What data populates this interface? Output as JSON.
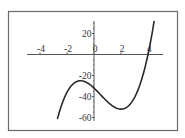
{
  "chart_data": {
    "type": "line",
    "title": "",
    "xlabel": "",
    "ylabel": "",
    "xlim": [
      -5,
      5
    ],
    "ylim": [
      -62,
      32
    ],
    "x_ticks": [
      -4,
      -2,
      0,
      2,
      4
    ],
    "y_ticks": [
      20,
      -20,
      -40,
      -60
    ],
    "x_tick_labels": [
      "-4",
      "-2",
      "0",
      "2",
      "4"
    ],
    "y_tick_labels": [
      "20",
      "-20",
      "-40",
      "-60"
    ],
    "grid": false,
    "legend": null,
    "series": [
      {
        "name": "f(x) = 2x^3 - 3x^2 - 12x - 32",
        "x_range": [
          -2.7,
          4.45
        ],
        "x": [
          -2.7,
          -2.5,
          -2,
          -1.5,
          -1,
          -0.5,
          0,
          0.5,
          1,
          1.5,
          2,
          2.5,
          3,
          3.5,
          4,
          4.25,
          4.45
        ],
        "values": [
          -60.9,
          -53.0,
          -36.0,
          -27.5,
          -25.0,
          -26.5,
          -32.0,
          -38.5,
          -45.0,
          -50.0,
          -52.0,
          -50.0,
          -41.0,
          -24.5,
          0.0,
          16.0,
          31.4
        ]
      }
    ],
    "key_points": {
      "local_max": [
        -1,
        -25
      ],
      "local_min": [
        2,
        -52
      ],
      "x_intercept": 4,
      "y_intercept": -32
    },
    "colors": {
      "curve": "#2a2a2a",
      "axes": "#555555",
      "frame": "#6a6a6a",
      "background": "#ffffff"
    }
  }
}
